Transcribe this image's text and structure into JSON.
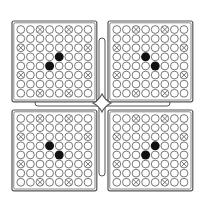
{
  "figure": {
    "colors": {
      "line": "#555555",
      "fill_dark": "#111111",
      "background": "#ffffff"
    },
    "grid_size": 8,
    "marked_cells": [
      [
        0,
        2
      ],
      [
        0,
        5
      ],
      [
        2,
        0
      ],
      [
        2,
        7
      ],
      [
        5,
        0
      ],
      [
        5,
        7
      ],
      [
        7,
        2
      ],
      [
        7,
        5
      ]
    ],
    "panels": [
      {
        "name": "top-left",
        "x": 12,
        "y": 21,
        "filled": [
          [
            3,
            4
          ],
          [
            4,
            3
          ]
        ]
      },
      {
        "name": "top-right",
        "x": 108,
        "y": 21,
        "filled": [
          [
            3,
            3
          ],
          [
            4,
            4
          ]
        ]
      },
      {
        "name": "bottom-left",
        "x": 12,
        "y": 110,
        "filled": [
          [
            3,
            3
          ],
          [
            4,
            4
          ]
        ]
      },
      {
        "name": "bottom-right",
        "x": 108,
        "y": 110,
        "filled": [
          [
            3,
            4
          ],
          [
            4,
            3
          ]
        ]
      }
    ],
    "connector": {
      "horizontal_bar": {
        "x1": 35,
        "x2": 170,
        "y": 103
      },
      "vertical_bar": {
        "x": 102,
        "y1": 38,
        "y2": 176
      },
      "center_joint": {
        "x": 102,
        "y": 103
      }
    }
  }
}
